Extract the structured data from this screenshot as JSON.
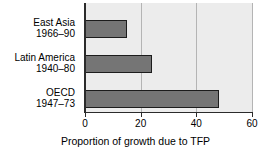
{
  "chart_data": {
    "type": "bar",
    "orientation": "horizontal",
    "title": "",
    "xlabel": "Proportion of growth due to TFP",
    "ylabel": "",
    "xlim": [
      0,
      60
    ],
    "ylim": null,
    "grid": true,
    "legend": null,
    "xticks": [
      0,
      20,
      40,
      60
    ],
    "xtick_labels": [
      "0",
      "20",
      "40",
      "60"
    ],
    "categories": [
      "East Asia 1966–90",
      "Latin America 1940–80",
      "OECD 1947–73"
    ],
    "category_lines": [
      {
        "line1": "East Asia",
        "line2": "1966–90"
      },
      {
        "line1": "Latin America",
        "line2": "1940–80"
      },
      {
        "line1": "OECD",
        "line2": "1947–73"
      }
    ],
    "values": [
      15,
      24,
      48
    ],
    "colors": {
      "bar_fill": "#757575",
      "bar_edge": "#1c1c1c",
      "plot_background": "#ececec",
      "gridline": "#b4b4b4",
      "axis": "#2b2b2b",
      "text": "#000000",
      "figure_background": "#ffffff"
    }
  }
}
